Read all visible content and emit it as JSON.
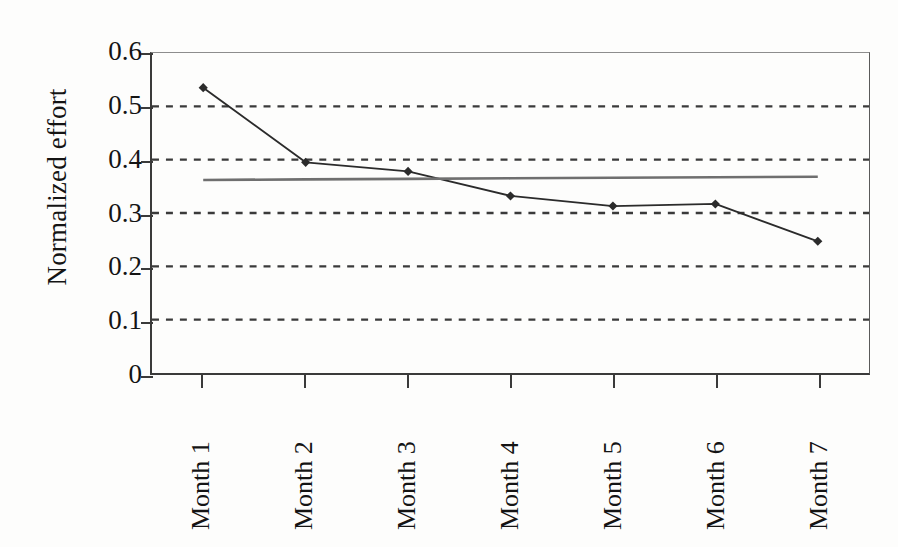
{
  "chart_data": {
    "type": "line",
    "title": "",
    "subtitle": "",
    "xlabel": "",
    "ylabel": "Normalized effort",
    "categories": [
      "Month 1",
      "Month 2",
      "Month 3",
      "Month 4",
      "Month 5",
      "Month 6",
      "Month 7"
    ],
    "ylim": [
      0,
      0.6
    ],
    "y_ticks": [
      0.6,
      0.5,
      0.4,
      0.3,
      0.2,
      0.1,
      0
    ],
    "y_tick_labels": [
      "0.6",
      "0.5",
      "0.4",
      "0.3",
      "0.2",
      "0.1",
      "0"
    ],
    "grid": true,
    "grid_style": "dashed-horizontal",
    "legend": false,
    "legend_position": "none",
    "x_tick_label_rotation": -90,
    "series": [
      {
        "name": "Normalized effort",
        "type": "line",
        "marker": "diamond",
        "color": "#2b2b2b",
        "values": [
          0.535,
          0.395,
          0.378,
          0.332,
          0.313,
          0.317,
          0.247
        ]
      },
      {
        "name": "Trend line",
        "type": "line",
        "marker": "none",
        "color": "#6f6f6f",
        "values": [
          0.362,
          0.363,
          0.364,
          0.365,
          0.366,
          0.367,
          0.368
        ]
      }
    ]
  },
  "axes": {
    "y_title": "Normalized effort"
  },
  "colors": {
    "series_line": "#2b2b2b",
    "trend_line": "#6f6f6f",
    "grid": "#3a3a3a",
    "axis": "#3a3a3a",
    "background": "#fdfdfc"
  }
}
